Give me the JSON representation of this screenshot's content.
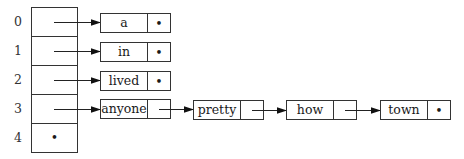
{
  "diagram": {
    "type": "hash-table-with-chaining",
    "array": {
      "indices": [
        "0",
        "1",
        "2",
        "3",
        "4"
      ],
      "slots": [
        {
          "index": "0",
          "points_to": "a"
        },
        {
          "index": "1",
          "points_to": "in"
        },
        {
          "index": "2",
          "points_to": "lived"
        },
        {
          "index": "3",
          "points_to": "anyone"
        },
        {
          "index": "4",
          "points_to": null,
          "null_marker": "•"
        }
      ]
    },
    "chains": [
      {
        "bucket": "0",
        "nodes": [
          {
            "value": "a",
            "next": "•"
          }
        ]
      },
      {
        "bucket": "1",
        "nodes": [
          {
            "value": "in",
            "next": "•"
          }
        ]
      },
      {
        "bucket": "2",
        "nodes": [
          {
            "value": "lived",
            "next": "•"
          }
        ]
      },
      {
        "bucket": "3",
        "nodes": [
          {
            "value": "anyone",
            "next": "pretty"
          },
          {
            "value": "pretty",
            "next": "how"
          },
          {
            "value": "how",
            "next": "town"
          },
          {
            "value": "town",
            "next": "•"
          }
        ]
      }
    ],
    "null_symbol": "•",
    "colors": {
      "stroke": "#333333",
      "text": "#1a1a1a",
      "background": "#ffffff"
    }
  }
}
